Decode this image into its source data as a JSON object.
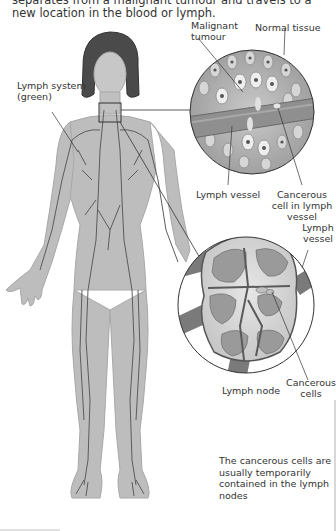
{
  "intro_text": "separates from a malignant tumour and travels to a new location in the blood or lymph.",
  "labels": {
    "malignant_tumour": "Malignant tumour",
    "normal_tissue": "Normal tissue",
    "lymph_system": "Lymph system (green)",
    "lymph_vessel_top": "Lymph vessel",
    "cancerous_cell_in_vessel": "Cancerous cell in lymph vessel",
    "lymph_vessel_right": "Lymph vessel",
    "cancerous_cells": "Cancerous cells",
    "lymph_node": "Lymph node"
  },
  "caption": "The cancerous cells are usually temporarily contained in the lymph nodes",
  "colors": {
    "body": "#b9b9b9",
    "vessel": "#5a5a5a",
    "tissue": "#9a9a9a",
    "outline": "#333333"
  }
}
